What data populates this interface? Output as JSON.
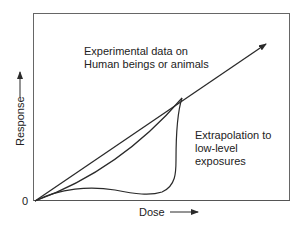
{
  "diagram": {
    "type": "dose-response",
    "origin_label": "0",
    "x_axis_label": "Dose",
    "y_axis_label": "Response",
    "annotation_experimental": {
      "line1": "Experimental data on",
      "line2": "Human beings or animals"
    },
    "annotation_extrapolation": {
      "line1": "Extrapolation to",
      "line2": "low-level",
      "line3": "exposures"
    },
    "curves": [
      {
        "name": "linear",
        "description": "Straight line from origin through experimental data, continuing with arrow"
      },
      {
        "name": "supralinear-to-sublinear",
        "description": "Convex curve from origin to data point"
      },
      {
        "name": "threshold/hormesis",
        "description": "Curve with low-dose dip, rising sharply to data point"
      }
    ],
    "colors": {
      "line": "#2a2a2a",
      "frame": "#555555",
      "background": "#ffffff"
    }
  }
}
